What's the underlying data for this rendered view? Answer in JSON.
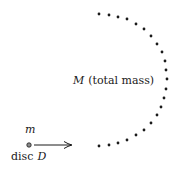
{
  "diagram": {
    "shell_label_var": "M",
    "shell_label_text": "(total mass)",
    "disc_mass_label": "m",
    "disc_label_text": "disc",
    "disc_label_var": "D",
    "colors": {
      "ink": "#1a1a1a",
      "disc_fill": "#8a8a8a",
      "background": "#ffffff"
    },
    "shell_dots": [
      [
        99,
        14
      ],
      [
        109,
        15
      ],
      [
        118,
        17
      ],
      [
        127,
        19
      ],
      [
        136,
        24
      ],
      [
        144,
        29
      ],
      [
        151,
        36
      ],
      [
        157,
        44
      ],
      [
        162,
        52
      ],
      [
        165,
        61
      ],
      [
        166,
        70
      ],
      [
        167,
        79
      ],
      [
        166,
        89
      ],
      [
        164,
        98
      ],
      [
        161,
        107
      ],
      [
        157,
        115
      ],
      [
        151,
        123
      ],
      [
        144,
        130
      ],
      [
        136,
        135
      ],
      [
        127,
        140
      ],
      [
        118,
        143
      ],
      [
        109,
        145
      ],
      [
        99,
        146
      ]
    ],
    "disc": {
      "cx": 29,
      "cy": 145,
      "r": 2.2
    },
    "arrow": {
      "x1": 34,
      "y1": 145,
      "x2": 72,
      "y2": 145
    }
  }
}
